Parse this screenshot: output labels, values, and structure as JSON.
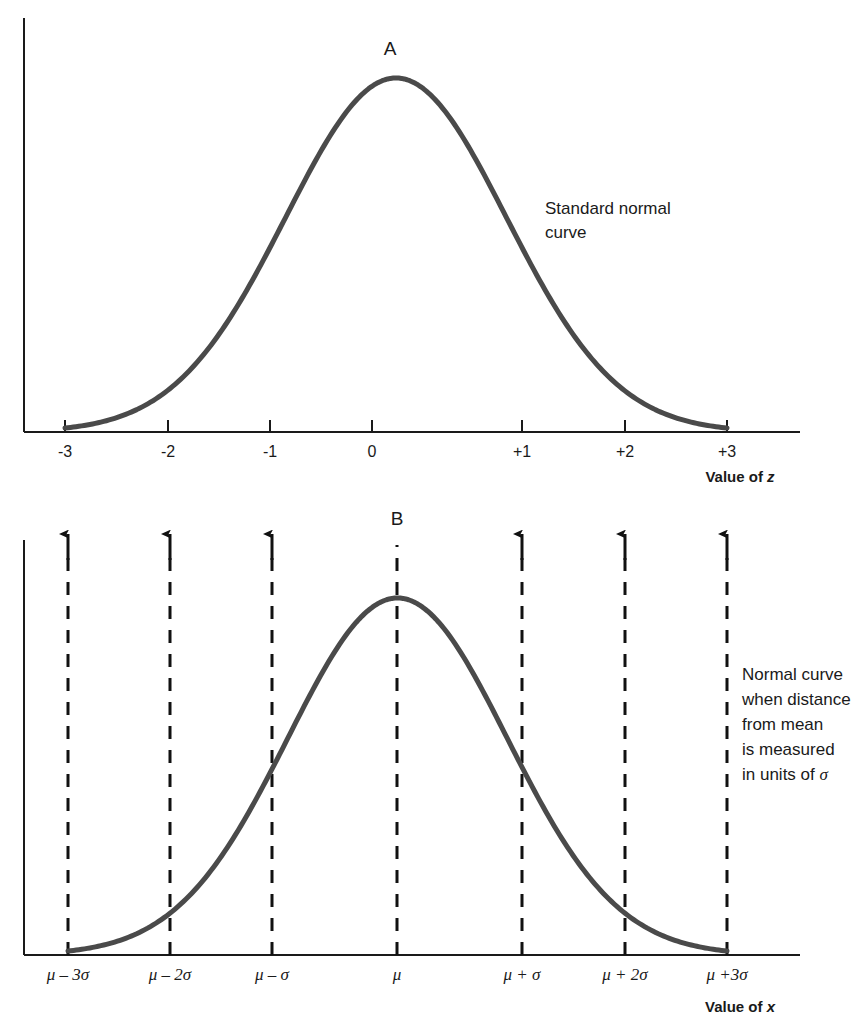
{
  "figure": {
    "background_color": "#ffffff",
    "curve_color": "#4a4a4a",
    "axis_color": "#1a1a1a",
    "dash_color": "#111111"
  },
  "panel_a": {
    "letter": "A",
    "annotation_line1": "Standard normal",
    "annotation_line2": "curve",
    "axis_title_prefix": "Value of ",
    "axis_title_var": "z",
    "ticks": [
      "-3",
      "-2",
      "-1",
      "0",
      "+1",
      "+2",
      "+3"
    ]
  },
  "panel_b": {
    "letter": "B",
    "annotation_line1": "Normal curve",
    "annotation_line2": "when distance",
    "annotation_line3": "from mean",
    "annotation_line4": "is measured",
    "annotation_line5_prefix": "in units of ",
    "annotation_line5_sigma": "σ",
    "axis_title_prefix": "Value of ",
    "axis_title_var": "x",
    "ticks": [
      "μ – 3σ",
      "μ – 2σ",
      "μ – σ",
      "μ",
      "μ + σ",
      "μ + 2σ",
      "μ +3σ"
    ]
  },
  "chart_data": [
    {
      "type": "line",
      "title": "A",
      "subtitle": "Standard normal curve",
      "xlabel": "Value of z",
      "ylabel": "",
      "xlim": [
        -3,
        3
      ],
      "ylim": [
        0,
        0.3989
      ],
      "xticks": [
        -3,
        -2,
        -1,
        0,
        1,
        2,
        3
      ],
      "xticklabels": [
        "-3",
        "-2",
        "-1",
        "0",
        "+1",
        "+2",
        "+3"
      ],
      "grid": false,
      "legend": "none",
      "annotations": [
        "Standard normal curve"
      ],
      "series": [
        {
          "name": "standard normal pdf",
          "x": [
            -3.0,
            -2.75,
            -2.5,
            -2.25,
            -2.0,
            -1.75,
            -1.5,
            -1.25,
            -1.0,
            -0.75,
            -0.5,
            -0.25,
            0.0,
            0.25,
            0.5,
            0.75,
            1.0,
            1.25,
            1.5,
            1.75,
            2.0,
            2.25,
            2.5,
            2.75,
            3.0
          ],
          "y": [
            0.0044,
            0.0091,
            0.0175,
            0.0317,
            0.054,
            0.0863,
            0.1295,
            0.1826,
            0.242,
            0.3011,
            0.3521,
            0.3867,
            0.3989,
            0.3867,
            0.3521,
            0.3011,
            0.242,
            0.1826,
            0.1295,
            0.0863,
            0.054,
            0.0317,
            0.0175,
            0.0091,
            0.0044
          ]
        }
      ]
    },
    {
      "type": "line",
      "title": "B",
      "subtitle": "Normal curve when distance from mean is measured in units of σ",
      "xlabel": "Value of x",
      "ylabel": "",
      "xlim": [
        -3,
        3
      ],
      "ylim": [
        0,
        0.3989
      ],
      "xticks": [
        -3,
        -2,
        -1,
        0,
        1,
        2,
        3
      ],
      "xticklabels": [
        "μ – 3σ",
        "μ – 2σ",
        "μ – σ",
        "μ",
        "μ + σ",
        "μ + 2σ",
        "μ +3σ"
      ],
      "grid": false,
      "legend": "none",
      "annotations": [
        "Normal curve when distance from mean is measured in units of σ"
      ],
      "vertical_markers": [
        {
          "x": -3,
          "arrow": true
        },
        {
          "x": -2,
          "arrow": true
        },
        {
          "x": -1,
          "arrow": true
        },
        {
          "x": 0,
          "arrow": false
        },
        {
          "x": 1,
          "arrow": true
        },
        {
          "x": 2,
          "arrow": true
        },
        {
          "x": 3,
          "arrow": true
        }
      ],
      "series": [
        {
          "name": "normal pdf",
          "x": [
            -3.0,
            -2.75,
            -2.5,
            -2.25,
            -2.0,
            -1.75,
            -1.5,
            -1.25,
            -1.0,
            -0.75,
            -0.5,
            -0.25,
            0.0,
            0.25,
            0.5,
            0.75,
            1.0,
            1.25,
            1.5,
            1.75,
            2.0,
            2.25,
            2.5,
            2.75,
            3.0
          ],
          "y": [
            0.0044,
            0.0091,
            0.0175,
            0.0317,
            0.054,
            0.0863,
            0.1295,
            0.1826,
            0.242,
            0.3011,
            0.3521,
            0.3867,
            0.3989,
            0.3867,
            0.3521,
            0.3011,
            0.242,
            0.1826,
            0.1295,
            0.0863,
            0.054,
            0.0317,
            0.0175,
            0.0091,
            0.0044
          ]
        }
      ]
    }
  ]
}
